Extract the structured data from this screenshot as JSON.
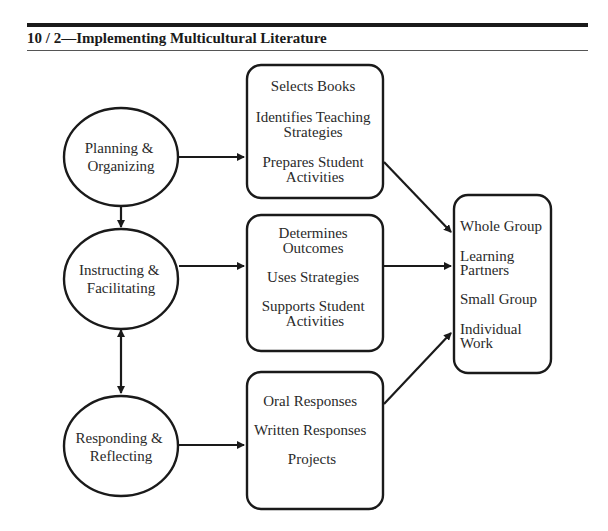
{
  "header": {
    "title": "10 / 2—Implementing Multicultural Literature"
  },
  "diagram": {
    "stages": [
      {
        "id": "planning",
        "lines": [
          "Planning &",
          "Organizing"
        ]
      },
      {
        "id": "instructing",
        "lines": [
          "Instructing &",
          "Facilitating"
        ]
      },
      {
        "id": "responding",
        "lines": [
          "Responding &",
          "Reflecting"
        ]
      }
    ],
    "activity_boxes": [
      {
        "id": "planning-activities",
        "items": [
          [
            "Selects Books"
          ],
          [
            "Identifies Teaching",
            "Strategies"
          ],
          [
            "Prepares Student",
            "Activities"
          ]
        ]
      },
      {
        "id": "instructing-activities",
        "items": [
          [
            "Determines",
            "Outcomes"
          ],
          [
            "Uses Strategies"
          ],
          [
            "Supports Student",
            "Activities"
          ]
        ]
      },
      {
        "id": "responding-activities",
        "items": [
          [
            "Oral Responses"
          ],
          [
            "Written Responses"
          ],
          [
            "Projects"
          ]
        ]
      }
    ],
    "grouping_box": {
      "id": "grouping",
      "items": [
        [
          "Whole Group"
        ],
        [
          "Learning",
          "Partners"
        ],
        [
          "Small Group"
        ],
        [
          "Individual",
          "Work"
        ]
      ]
    },
    "connections": [
      {
        "from": "planning",
        "to": "planning-activities",
        "type": "arrow"
      },
      {
        "from": "instructing",
        "to": "instructing-activities",
        "type": "arrow"
      },
      {
        "from": "responding",
        "to": "responding-activities",
        "type": "arrow"
      },
      {
        "from": "planning",
        "to": "instructing",
        "type": "double-arrow"
      },
      {
        "from": "instructing",
        "to": "responding",
        "type": "double-arrow"
      },
      {
        "from": "planning-activities",
        "to": "grouping",
        "type": "arrow"
      },
      {
        "from": "instructing-activities",
        "to": "grouping",
        "type": "arrow"
      },
      {
        "from": "responding-activities",
        "to": "grouping",
        "type": "arrow"
      }
    ]
  }
}
